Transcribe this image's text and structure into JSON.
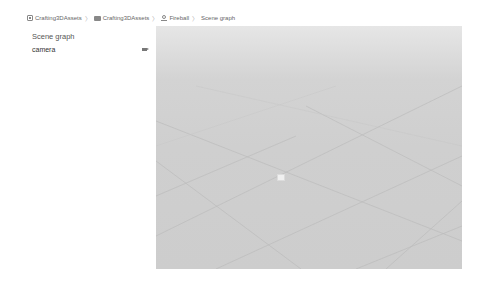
{
  "breadcrumb": {
    "items": [
      {
        "label": "Crafting3DAssets",
        "icon": "project-icon"
      },
      {
        "label": "Crafting3DAssets",
        "icon": "folder-icon"
      },
      {
        "label": "Fireball",
        "icon": "asset-icon"
      },
      {
        "label": "Scene graph",
        "icon": null
      }
    ],
    "separator": "〉"
  },
  "sidebar": {
    "title": "Scene graph",
    "items": [
      {
        "label": "camera",
        "icon": "camera-icon"
      }
    ]
  },
  "viewport": {
    "background_top": "#e6e6e6",
    "background_bottom": "#cdcdcd",
    "grid_color": "#bdbdbd",
    "marker": "camera-marker"
  }
}
